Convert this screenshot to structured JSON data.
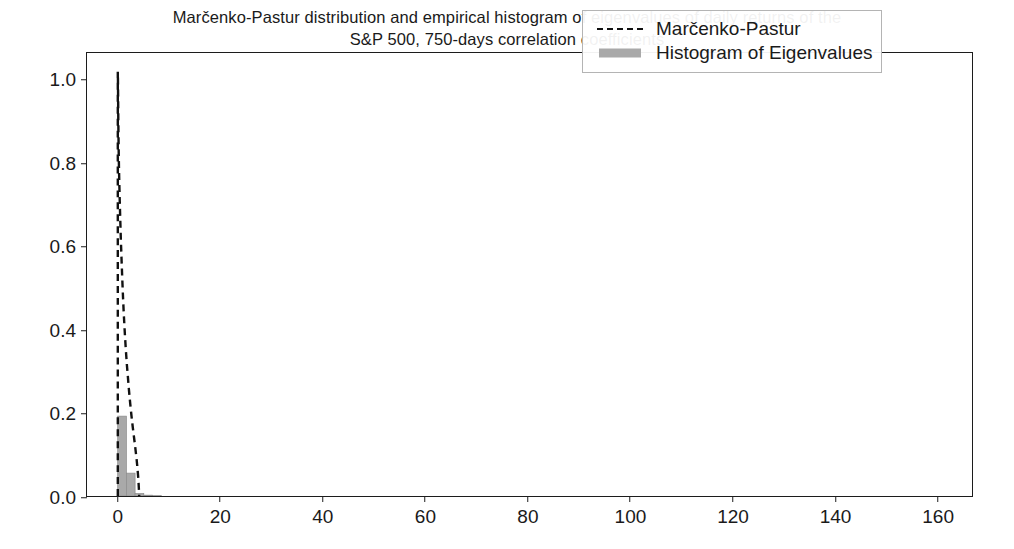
{
  "chart_data": {
    "type": "line",
    "title": "Marčenko-Pastur distribution and empirical histogram of eigenvalues of daily returns of the\nS&P 500, 750-days correlation coefficients",
    "xlabel": "",
    "ylabel": "",
    "xlim": [
      -6,
      167
    ],
    "ylim": [
      0.0,
      1.065
    ],
    "grid": false,
    "legend_position": "upper right",
    "xticks": [
      0,
      20,
      40,
      60,
      80,
      100,
      120,
      140,
      160
    ],
    "xtick_labels": [
      "0",
      "20",
      "40",
      "60",
      "80",
      "100",
      "120",
      "140",
      "160"
    ],
    "yticks": [
      0.0,
      0.2,
      0.4,
      0.6,
      0.8,
      1.0
    ],
    "ytick_labels": [
      "0.0",
      "0.2",
      "0.4",
      "0.6",
      "0.8",
      "1.0"
    ],
    "series": [
      {
        "name": "Marčenko-Pastur",
        "type": "line",
        "style": "dashed",
        "color": "#111111",
        "linewidth": 2.2,
        "x": [
          0.02,
          0.05,
          0.08,
          0.12,
          0.18,
          0.25,
          0.32,
          0.4,
          0.5,
          0.62,
          0.75,
          0.9,
          1.05,
          1.2,
          1.4,
          1.6,
          1.8,
          2.0,
          2.2,
          2.45,
          2.7,
          2.95,
          3.2,
          3.45,
          3.7,
          3.9,
          4.05,
          4.15,
          4.2
        ],
        "y": [
          1.02,
          1.0,
          0.96,
          0.9,
          0.84,
          0.79,
          0.75,
          0.71,
          0.665,
          0.615,
          0.57,
          0.52,
          0.475,
          0.435,
          0.39,
          0.35,
          0.315,
          0.285,
          0.255,
          0.222,
          0.192,
          0.165,
          0.14,
          0.115,
          0.088,
          0.062,
          0.038,
          0.015,
          0.0
        ]
      },
      {
        "name": "Histogram of Eigenvalues",
        "type": "bar",
        "color": "#a9a9a9",
        "edgecolor": "#8c8c8c",
        "bin_width": 1.7,
        "bin_centers": [
          0.85,
          2.55,
          4.25,
          5.95,
          7.65
        ],
        "values": [
          0.192,
          0.055,
          0.006,
          0.002,
          0.001
        ]
      }
    ],
    "annotations": []
  },
  "legend": {
    "entries": [
      {
        "label": "Marčenko-Pastur",
        "key": "dashed-line-key"
      },
      {
        "label": "Histogram of Eigenvalues",
        "key": "filled-patch-key"
      }
    ]
  },
  "colors": {
    "line": "#111111",
    "bars": "#a9a9a9",
    "axis": "#1c1c1c",
    "text": "#1a1a1a",
    "background": "#ffffff"
  }
}
